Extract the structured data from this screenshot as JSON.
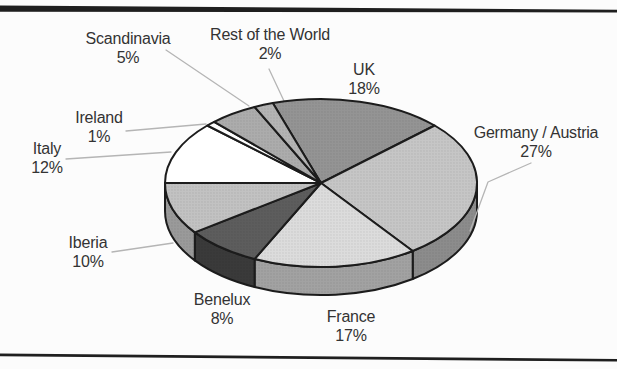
{
  "page": {
    "kind": "scanned-figure",
    "background": "#fcfcfc",
    "rules": {
      "ink": "#1f1f1f"
    }
  },
  "chart_data": {
    "type": "pie",
    "style": "3d",
    "title": "",
    "legend": "none",
    "direction": "clockwise",
    "start_angle_deg": -18,
    "categories": [
      "UK",
      "Germany / Austria",
      "France",
      "Benelux",
      "Iberia",
      "Italy",
      "Ireland",
      "Scandinavia",
      "Rest of the World"
    ],
    "values": [
      18,
      27,
      17,
      8,
      10,
      12,
      1,
      5,
      2
    ],
    "slices": [
      {
        "name": "UK",
        "pct": 18,
        "pct_label": "18%",
        "fill": "#949494",
        "side": null,
        "halftone": true,
        "label_x": 364,
        "label_y": 61,
        "leader": null
      },
      {
        "name": "Germany / Austria",
        "pct": 27,
        "pct_label": "27%",
        "fill": "#c6c6c6",
        "side": "#8c8c8c",
        "halftone": true,
        "label_x": 536,
        "label_y": 124,
        "leader": [
          [
            531,
            163
          ],
          [
            488,
            182
          ],
          [
            470,
            231
          ]
        ]
      },
      {
        "name": "France",
        "pct": 17,
        "pct_label": "17%",
        "fill": "#dcdcdc",
        "side": "#a2a2a2",
        "halftone": true,
        "label_x": 351,
        "label_y": 308,
        "leader": null
      },
      {
        "name": "Benelux",
        "pct": 8,
        "pct_label": "8%",
        "fill": "#5d5d5d",
        "side": "#3a3a3a",
        "halftone": true,
        "label_x": 222,
        "label_y": 291,
        "leader": null
      },
      {
        "name": "Iberia",
        "pct": 10,
        "pct_label": "10%",
        "fill": "#c2c2c2",
        "side": "#9a9a9a",
        "halftone": true,
        "label_x": 88,
        "label_y": 234,
        "leader": [
          [
            112,
            252
          ],
          [
            173,
            243
          ]
        ]
      },
      {
        "name": "Italy",
        "pct": 12,
        "pct_label": "12%",
        "fill": "#ffffff",
        "side": null,
        "halftone": false,
        "label_x": 47,
        "label_y": 140,
        "leader": [
          [
            66,
            159
          ],
          [
            171,
            152
          ]
        ]
      },
      {
        "name": "Ireland",
        "pct": 1,
        "pct_label": "1%",
        "fill": "#fdfdfd",
        "side": null,
        "halftone": false,
        "label_x": 99,
        "label_y": 109,
        "leader": [
          [
            126,
            131
          ],
          [
            206,
            124
          ]
        ]
      },
      {
        "name": "Scandinavia",
        "pct": 5,
        "pct_label": "5%",
        "fill": "#acacac",
        "side": null,
        "halftone": true,
        "label_x": 128,
        "label_y": 30,
        "leader": [
          [
            166,
            50
          ],
          [
            249,
            106
          ]
        ]
      },
      {
        "name": "Rest of the World",
        "pct": 2,
        "pct_label": "2%",
        "fill": "#b4b4b4",
        "side": null,
        "halftone": true,
        "label_x": 270,
        "label_y": 26,
        "leader": [
          [
            269,
            69
          ],
          [
            284,
            101
          ]
        ]
      }
    ],
    "geometry": {
      "cx": 321,
      "cy": 183,
      "rx": 156,
      "ry": 84,
      "depth": 28
    },
    "ink": {
      "outline": "#1c1c1c",
      "leader": "#b5b5b5",
      "text": "#333333"
    }
  }
}
